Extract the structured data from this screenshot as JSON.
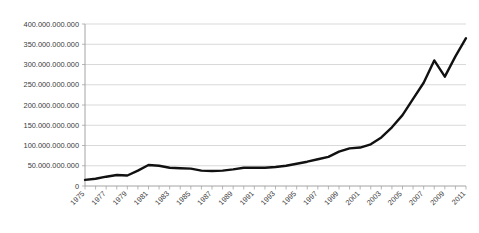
{
  "title_strip": "",
  "chart_data": {
    "type": "line",
    "title": "",
    "subtitle": "",
    "xlabel": "",
    "ylabel": "",
    "grid": "horizontal",
    "legend": "none",
    "line_color": "#111111",
    "gridline_color": "#c9c9c9",
    "axis_color": "#9a9a9a",
    "background_color": "#ffffff",
    "xlim": [
      1975,
      2011
    ],
    "ylim": [
      0,
      400000000000
    ],
    "ytick_step": 50000000000,
    "ytick_labels": [
      "400.000.000.000",
      "350.000.000.000",
      "300.000.000.000",
      "250.000.000.000",
      "200.000.000.000",
      "150.000.000.000",
      "100.000.000.000",
      "50.000.000.000",
      "0"
    ],
    "ytick_values": [
      400000000000,
      350000000000,
      300000000000,
      250000000000,
      200000000000,
      150000000000,
      100000000000,
      50000000000,
      0
    ],
    "xtick_labels": [
      "1975",
      "1977",
      "1979",
      "1981",
      "1983",
      "1985",
      "1987",
      "1989",
      "1991",
      "1993",
      "1995",
      "1997",
      "1999",
      "2001",
      "2003",
      "2005",
      "2007",
      "2009",
      "2011"
    ],
    "xtick_label_interval_years": 2,
    "xtick_minor_interval_years": 1,
    "xtick_label_rotation_deg": 45,
    "x": [
      1975,
      1976,
      1977,
      1978,
      1979,
      1980,
      1981,
      1982,
      1983,
      1984,
      1985,
      1986,
      1987,
      1988,
      1989,
      1990,
      1991,
      1992,
      1993,
      1994,
      1995,
      1996,
      1997,
      1998,
      1999,
      2000,
      2001,
      2002,
      2003,
      2004,
      2005,
      2006,
      2007,
      2008,
      2009,
      2010,
      2011
    ],
    "values": [
      15000000000,
      18000000000,
      23000000000,
      27000000000,
      26000000000,
      38000000000,
      52000000000,
      50000000000,
      45000000000,
      44000000000,
      43000000000,
      38000000000,
      37000000000,
      38000000000,
      41000000000,
      45000000000,
      45000000000,
      45000000000,
      47000000000,
      50000000000,
      55000000000,
      60000000000,
      66000000000,
      72000000000,
      85000000000,
      93000000000,
      95000000000,
      103000000000,
      120000000000,
      145000000000,
      175000000000,
      215000000000,
      255000000000,
      310000000000,
      270000000000,
      320000000000,
      365000000000
    ],
    "series_name": "value"
  }
}
